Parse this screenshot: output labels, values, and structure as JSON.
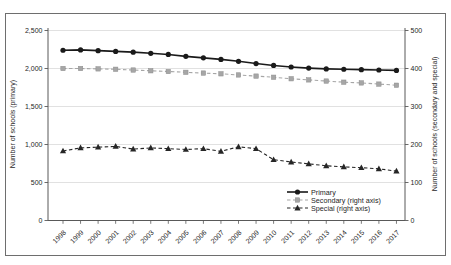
{
  "figure": {
    "border_color": "#6e6e6e",
    "background": "#ffffff"
  },
  "chart_data": {
    "type": "line",
    "title": "",
    "x_categories": [
      "1998",
      "1999",
      "2000",
      "2001",
      "2002",
      "2003",
      "2004",
      "2005",
      "2006",
      "2007",
      "2008",
      "2009",
      "2010",
      "2011",
      "2012",
      "2013",
      "2014",
      "2015",
      "2016",
      "2017"
    ],
    "left_axis": {
      "label": "Number of schools (primary)",
      "lim": [
        0,
        2500
      ],
      "tick_labels": [
        "0",
        "500",
        "1,000",
        "1,500",
        "2,000",
        "2,500"
      ]
    },
    "right_axis": {
      "label": "Number of schools (secondary and special)",
      "lim": [
        0,
        500
      ],
      "tick_labels": [
        "0",
        "100",
        "200",
        "300",
        "400",
        "500"
      ]
    },
    "grid": true,
    "legend_position": "inside-bottom-center",
    "series": [
      {
        "name": "Primary",
        "axis": "left",
        "marker": "circle",
        "line_style": "solid",
        "color": "#1a1a1a",
        "values": [
          2240,
          2245,
          2235,
          2225,
          2215,
          2200,
          2185,
          2160,
          2140,
          2120,
          2095,
          2065,
          2040,
          2020,
          2005,
          1995,
          1990,
          1985,
          1980,
          1975
        ]
      },
      {
        "name": "Secondary (right axis)",
        "axis": "right",
        "marker": "square",
        "line_style": "dashed",
        "color": "#a6a6a6",
        "values": [
          400,
          400,
          399,
          398,
          396,
          394,
          392,
          390,
          388,
          386,
          383,
          380,
          377,
          373,
          370,
          367,
          364,
          362,
          359,
          356
        ]
      },
      {
        "name": "Special (right axis)",
        "axis": "right",
        "marker": "triangle",
        "line_style": "dashed",
        "color": "#262626",
        "values": [
          183,
          191,
          193,
          195,
          188,
          191,
          189,
          187,
          189,
          182,
          194,
          189,
          160,
          154,
          149,
          144,
          141,
          139,
          136,
          130
        ]
      }
    ],
    "style": {
      "grid_color": "#d9d9d9",
      "axis_color": "#595959",
      "text_color": "#262626"
    }
  }
}
